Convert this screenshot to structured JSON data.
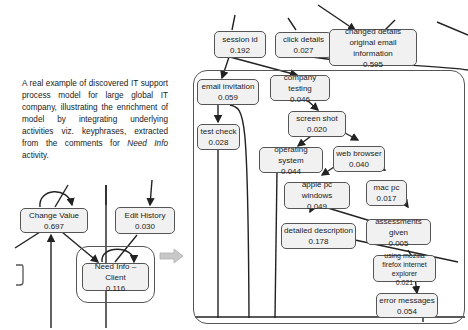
{
  "caption": {
    "text_before": "A real example of discovered IT support process model for large global IT company, illustrating the enrichment of model by integrating underlying activities viz. keyphrases, extracted from the comments for ",
    "italic": "Need Info",
    "text_after": " activity."
  },
  "left_model": {
    "nodes": [
      {
        "id": "change-value",
        "label": "Change Value",
        "value": "0.697"
      },
      {
        "id": "edit-history",
        "label": "Edit History",
        "value": "0.030"
      },
      {
        "id": "need-info-client",
        "label": "Need Info – Client",
        "value": "0.116"
      }
    ]
  },
  "right_model": {
    "nodes": [
      {
        "id": "session-id",
        "label": "session id",
        "value": "0.192"
      },
      {
        "id": "click-details",
        "label": "click details",
        "value": "0.027"
      },
      {
        "id": "changed-details",
        "label": "changed details original email information",
        "value": "0.595"
      },
      {
        "id": "email-invitation",
        "label": "email invitation",
        "value": "0.059"
      },
      {
        "id": "company-testing",
        "label": "company testing",
        "value": "0.046"
      },
      {
        "id": "test-check",
        "label": "test check",
        "value": "0.028"
      },
      {
        "id": "screen-shot",
        "label": "screen shot",
        "value": "0.020"
      },
      {
        "id": "operating-system",
        "label": "operating system",
        "value": "0.044"
      },
      {
        "id": "web-browser",
        "label": "web browser",
        "value": "0.040"
      },
      {
        "id": "apple-pc-windows",
        "label": "apple pc windows",
        "value": "0.049"
      },
      {
        "id": "mac-pc",
        "label": "mac pc",
        "value": "0.017"
      },
      {
        "id": "detailed-description",
        "label": "detailed description",
        "value": "0.178"
      },
      {
        "id": "assessments-given",
        "label": "assessments given",
        "value": "0.005"
      },
      {
        "id": "using-mozilla",
        "label": "using mozilla firefox internet explorer",
        "value": "0.021"
      },
      {
        "id": "error-messages",
        "label": "error messages",
        "value": "0.054"
      }
    ]
  },
  "colors": {
    "node_fill": "#f1f1f1",
    "border": "#555555",
    "arrow": "#bbbbbb"
  }
}
